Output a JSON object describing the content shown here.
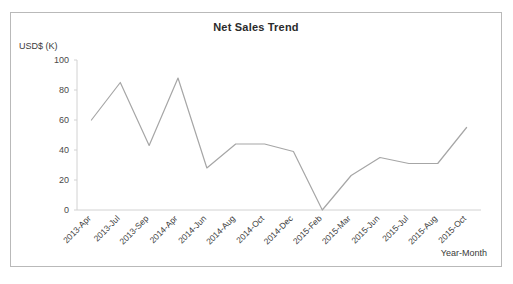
{
  "chart_data": {
    "type": "line",
    "title": "Net Sales Trend",
    "xlabel": "Year-Month",
    "ylabel": "USD$ (K)",
    "categories": [
      "2013-Apr",
      "2013-Jul",
      "2013-Sep",
      "2014-Apr",
      "2014-Jun",
      "2014-Aug",
      "2014-Oct",
      "2014-Dec",
      "2015-Feb",
      "2015-Mar",
      "2015-Jun",
      "2015-Jul",
      "2015-Aug",
      "2015-Oct"
    ],
    "values": [
      60,
      85,
      43,
      88,
      28,
      44,
      44,
      39,
      0,
      23,
      35,
      31,
      31,
      55
    ],
    "series": [
      {
        "name": "Net Sales",
        "values": [
          60,
          85,
          43,
          88,
          28,
          44,
          44,
          39,
          0,
          23,
          35,
          31,
          31,
          55
        ]
      }
    ],
    "ylim": [
      0,
      100
    ],
    "yticks": [
      0,
      20,
      40,
      60,
      80,
      100
    ],
    "ytick_labels": [
      "0",
      "20",
      "40",
      "60",
      "80",
      "100"
    ],
    "grid": false,
    "legend": "none",
    "line_color": "#a6a6a6",
    "axis_color": "#d0d0d0",
    "border_color": "#b9b9b9",
    "x_label_rotation": -45
  }
}
